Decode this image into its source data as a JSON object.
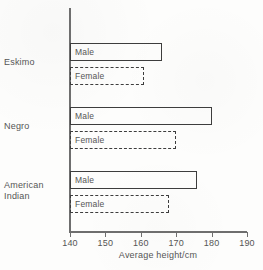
{
  "chart_data": {
    "type": "bar",
    "orientation": "horizontal",
    "title": "",
    "xlabel": "Average height/cm",
    "ylabel": "",
    "xlim": [
      140,
      190
    ],
    "xticks": [
      140,
      150,
      160,
      170,
      180,
      190
    ],
    "grid": false,
    "legend": "none",
    "categories": [
      "Eskimo",
      "Negro",
      "American Indian"
    ],
    "series": [
      {
        "name": "Male",
        "values": [
          166,
          180,
          176
        ]
      },
      {
        "name": "Female",
        "values": [
          161,
          170,
          168
        ]
      }
    ],
    "groups": [
      {
        "category": "Eskimo",
        "category_line1": "Eskimo",
        "category_line2": "",
        "bars": [
          {
            "label": "Male",
            "value": 166,
            "style": "solid"
          },
          {
            "label": "Female",
            "value": 161,
            "style": "dashed"
          }
        ]
      },
      {
        "category": "Negro",
        "category_line1": "Negro",
        "category_line2": "",
        "bars": [
          {
            "label": "Male",
            "value": 180,
            "style": "solid"
          },
          {
            "label": "Female",
            "value": 170,
            "style": "dashed"
          }
        ]
      },
      {
        "category": "American Indian",
        "category_line1": "American",
        "category_line2": "Indian",
        "bars": [
          {
            "label": "Male",
            "value": 176,
            "style": "solid"
          },
          {
            "label": "Female",
            "value": 168,
            "style": "dashed"
          }
        ]
      }
    ],
    "colors": {
      "bar_outline": "#3d3d3d",
      "axis": "#6e6e6e",
      "text": "#555555",
      "background": "#fdfdfc"
    }
  }
}
